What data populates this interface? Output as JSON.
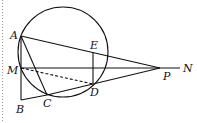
{
  "diagram": {
    "type": "geometry",
    "colors": {
      "stroke": "#111111",
      "border": "#999999",
      "background": "#ffffff"
    },
    "circle": {
      "cx": 63,
      "cy": 52,
      "r": 45
    },
    "points": {
      "A": {
        "label": "A",
        "x": 21,
        "y": 36
      },
      "M": {
        "label": "M",
        "x": 21,
        "y": 68
      },
      "B": {
        "label": "B",
        "x": 21,
        "y": 100
      },
      "C": {
        "label": "C",
        "x": 47,
        "y": 95
      },
      "D": {
        "label": "D",
        "x": 93,
        "y": 84
      },
      "E": {
        "label": "E",
        "x": 93,
        "y": 52
      },
      "P": {
        "label": "P",
        "x": 160,
        "y": 68
      },
      "N": {
        "label": "N",
        "x": 180,
        "y": 68
      }
    },
    "segments": [
      "AP",
      "AC",
      "AB",
      "BC",
      "CD",
      "DP",
      "ED",
      "MN"
    ],
    "dashed_segments": [
      "MD"
    ]
  }
}
